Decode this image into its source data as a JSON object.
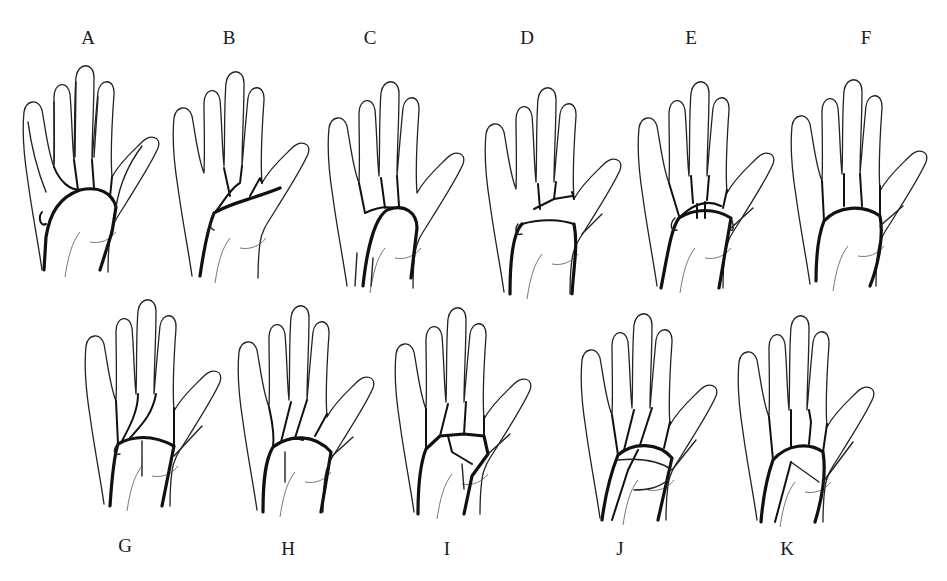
{
  "figure": {
    "panels": [
      {
        "id": "A",
        "label": "A",
        "x": 88,
        "y": 42,
        "hx": 20,
        "hy": 62,
        "row": "top",
        "variant": "full"
      },
      {
        "id": "B",
        "label": "B",
        "x": 229,
        "y": 42,
        "hx": 170,
        "hy": 68,
        "row": "top",
        "variant": "superficial-thenar"
      },
      {
        "id": "C",
        "label": "C",
        "x": 370,
        "y": 42,
        "hx": 325,
        "hy": 78,
        "row": "top",
        "variant": "radial-arch"
      },
      {
        "id": "D",
        "label": "D",
        "x": 527,
        "y": 42,
        "hx": 482,
        "hy": 84,
        "row": "top",
        "variant": "ulnar-arch"
      },
      {
        "id": "E",
        "label": "E",
        "x": 691,
        "y": 42,
        "hx": 635,
        "hy": 78,
        "row": "top",
        "variant": "double-arch"
      },
      {
        "id": "F",
        "label": "F",
        "x": 866,
        "y": 42,
        "hx": 788,
        "hy": 76,
        "row": "top",
        "variant": "closed-arch"
      },
      {
        "id": "G",
        "label": "G",
        "x": 125,
        "y": 550,
        "hx": 82,
        "hy": 296,
        "row": "bottom",
        "variant": "median-branch"
      },
      {
        "id": "H",
        "label": "H",
        "x": 288,
        "y": 553,
        "hx": 235,
        "hy": 302,
        "row": "bottom",
        "variant": "complete-arch"
      },
      {
        "id": "I",
        "label": "I",
        "x": 447,
        "y": 553,
        "hx": 392,
        "hy": 304,
        "row": "bottom",
        "variant": "network"
      },
      {
        "id": "J",
        "label": "J",
        "x": 620,
        "y": 553,
        "hx": 578,
        "hy": 310,
        "row": "bottom",
        "variant": "radio-median"
      },
      {
        "id": "K",
        "label": "K",
        "x": 787,
        "y": 553,
        "hx": 735,
        "hy": 312,
        "row": "bottom",
        "variant": "ulnar-median"
      }
    ]
  }
}
